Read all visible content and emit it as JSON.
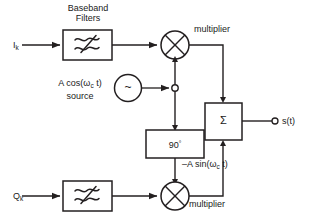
{
  "diagram": {
    "stroke_color": "#231f20",
    "background": "#ffffff",
    "labels": {
      "baseband_filters_line1": "Baseband",
      "baseband_filters_line2": "Filters",
      "input_i": "I",
      "input_i_sub": "k",
      "input_q": "Q",
      "input_q_sub": "k",
      "multiplier_top": "multiplier",
      "multiplier_bottom": "multiplier",
      "source_line1_pre": "A cos(ω",
      "source_line1_sub": "c",
      "source_line1_post": " t)",
      "source_line2": "source",
      "oscillator_symbol": "~",
      "phase_shift": "90",
      "phase_shift_degree": "°",
      "sum_symbol": "Σ",
      "carrier_quad_pre": "–A sin(ω",
      "carrier_quad_sub": "c",
      "carrier_quad_post": " t)",
      "output": "s(t)"
    },
    "icons": {
      "filter_i": "lowpass-filter-icon",
      "filter_q": "lowpass-filter-icon",
      "mixer_top": "multiplier-mixer-icon",
      "mixer_bottom": "multiplier-mixer-icon",
      "oscillator": "sine-source-icon",
      "summer": "summing-junction-icon",
      "node": "junction-node-icon",
      "terminal": "output-terminal-icon"
    }
  }
}
